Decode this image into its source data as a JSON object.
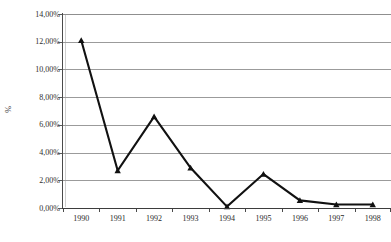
{
  "chart_data": {
    "type": "line",
    "title": "",
    "subtitle": "",
    "xlabel": "",
    "ylabel": "%",
    "categories": [
      "1990",
      "1991",
      "1992",
      "1993",
      "1994",
      "1995",
      "1996",
      "1997",
      "1998"
    ],
    "series": [
      {
        "name": "",
        "values": [
          12.1,
          2.7,
          6.6,
          2.9,
          0.1,
          2.45,
          0.55,
          0.25,
          0.25
        ]
      }
    ],
    "ylim": [
      0,
      14
    ],
    "y_tick_values": [
      0,
      2,
      4,
      6,
      8,
      10,
      12,
      14
    ],
    "y_tick_labels": [
      "0,00%",
      "2,00%",
      "4,00%",
      "6,00%",
      "8,00%",
      "10,00%",
      "12,00%",
      "14,00%"
    ],
    "value_labels": [
      "12,10%",
      "2,70%",
      "6,60%",
      "2,90%",
      "0,10%",
      "2,45%",
      "0,55%",
      "0,25%",
      "0,25%"
    ],
    "grid": true,
    "grid_orientation": "horizontal",
    "legend": false,
    "legend_position": "none",
    "marker": "triangle",
    "decimal_separator": ",",
    "colors": {
      "line": "#111111",
      "marker": "#111111",
      "gridline": "#9b9b9b",
      "axis": "#3d3d3d",
      "background": "#ffffff",
      "tick_label": "#2a2a2a"
    }
  }
}
